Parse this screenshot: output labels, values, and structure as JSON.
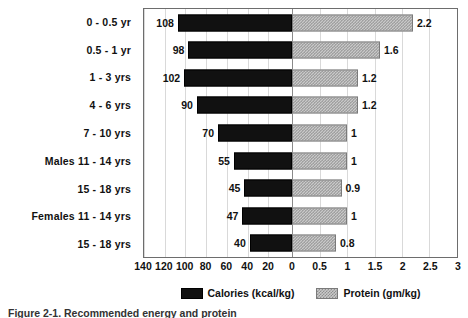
{
  "chart_data": {
    "type": "bar",
    "orientation": "horizontal",
    "style": "back-to-back diverging",
    "title": "",
    "caption": "Figure 2-1.  Recommended energy and protein",
    "categories": [
      "0 - 0.5 yr",
      "0.5 - 1 yr",
      "1 - 3 yrs",
      "4 - 6 yrs",
      "7 - 10 yrs",
      "Males 11 - 14 yrs",
      "15 - 18 yrs",
      "Females 11 - 14 yrs",
      "15 - 18 yrs"
    ],
    "series": [
      {
        "name": "Calories (kcal/kg)",
        "units": "kcal/kg",
        "direction": "left",
        "color": "#111111",
        "fill": "solid",
        "values": [
          108,
          98,
          102,
          90,
          70,
          55,
          45,
          47,
          40
        ]
      },
      {
        "name": "Protein (gm/kg)",
        "units": "gm/kg",
        "direction": "right",
        "color": "#c9c9c9",
        "fill": "hatched",
        "values": [
          2.2,
          1.6,
          1.2,
          1.2,
          1,
          1,
          0.9,
          1,
          0.8
        ]
      }
    ],
    "left_axis": {
      "ticks": [
        140,
        120,
        100,
        80,
        60,
        40,
        20,
        0
      ],
      "max": 140,
      "min": 0
    },
    "right_axis": {
      "ticks": [
        0,
        0.5,
        1,
        1.5,
        2,
        2.5,
        3
      ],
      "max": 3,
      "min": 0
    },
    "xlabel": "",
    "ylabel": "",
    "grid": true,
    "legend_position": "bottom"
  },
  "axis_ticks": [
    {
      "label": "140",
      "pos": 0.0
    },
    {
      "label": "120",
      "pos": 6.61
    },
    {
      "label": "100",
      "pos": 13.23
    },
    {
      "label": "80",
      "pos": 19.84
    },
    {
      "label": "60",
      "pos": 26.46
    },
    {
      "label": "40",
      "pos": 33.07
    },
    {
      "label": "20",
      "pos": 39.68
    },
    {
      "label": "0",
      "pos": 47.3
    },
    {
      "label": "0.5",
      "pos": 56.08
    },
    {
      "label": "1",
      "pos": 64.86
    },
    {
      "label": "1.5",
      "pos": 73.65
    },
    {
      "label": "2",
      "pos": 82.43
    },
    {
      "label": "2.5",
      "pos": 91.21
    },
    {
      "label": "3",
      "pos": 100.0
    }
  ],
  "gridlines": [
    0.0,
    6.61,
    13.23,
    19.84,
    26.46,
    33.07,
    39.68,
    47.3,
    56.08,
    64.86,
    73.65,
    82.43,
    91.21
  ],
  "legend": {
    "calories_label": "Calories (kcal/kg)",
    "protein_label": "Protein (gm/kg)"
  }
}
